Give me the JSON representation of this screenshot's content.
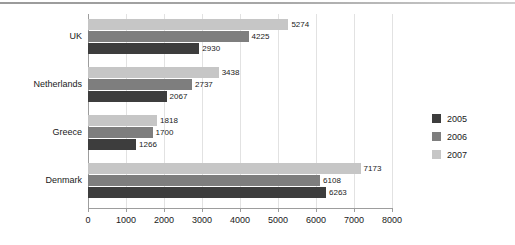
{
  "chart_data": {
    "type": "bar",
    "orientation": "horizontal",
    "title": "",
    "xlabel": "",
    "ylabel": "",
    "categories": [
      "UK",
      "Netherlands",
      "Greece",
      "Denmark"
    ],
    "series": [
      {
        "name": "2005",
        "color": "#3d3d3d",
        "values": [
          2930,
          2067,
          1266,
          6263
        ]
      },
      {
        "name": "2006",
        "color": "#7e7e7e",
        "values": [
          4225,
          2737,
          1700,
          6108
        ]
      },
      {
        "name": "2007",
        "color": "#c6c6c6",
        "values": [
          5274,
          3438,
          1818,
          7173
        ]
      }
    ],
    "xlim": [
      0,
      8000
    ],
    "xticks": [
      0,
      1000,
      2000,
      3000,
      4000,
      5000,
      6000,
      7000,
      8000
    ],
    "xtick_labels": [
      "0",
      "1000",
      "2000",
      "3000",
      "4000",
      "5000",
      "6000",
      "7000",
      "8000"
    ],
    "grid": true,
    "grid_axis": "x",
    "data_labels": true,
    "legend": {
      "position": "right",
      "entries": [
        {
          "label": "2005",
          "color": "#3d3d3d"
        },
        {
          "label": "2006",
          "color": "#7e7e7e"
        },
        {
          "label": "2007",
          "color": "#c6c6c6"
        }
      ]
    }
  }
}
